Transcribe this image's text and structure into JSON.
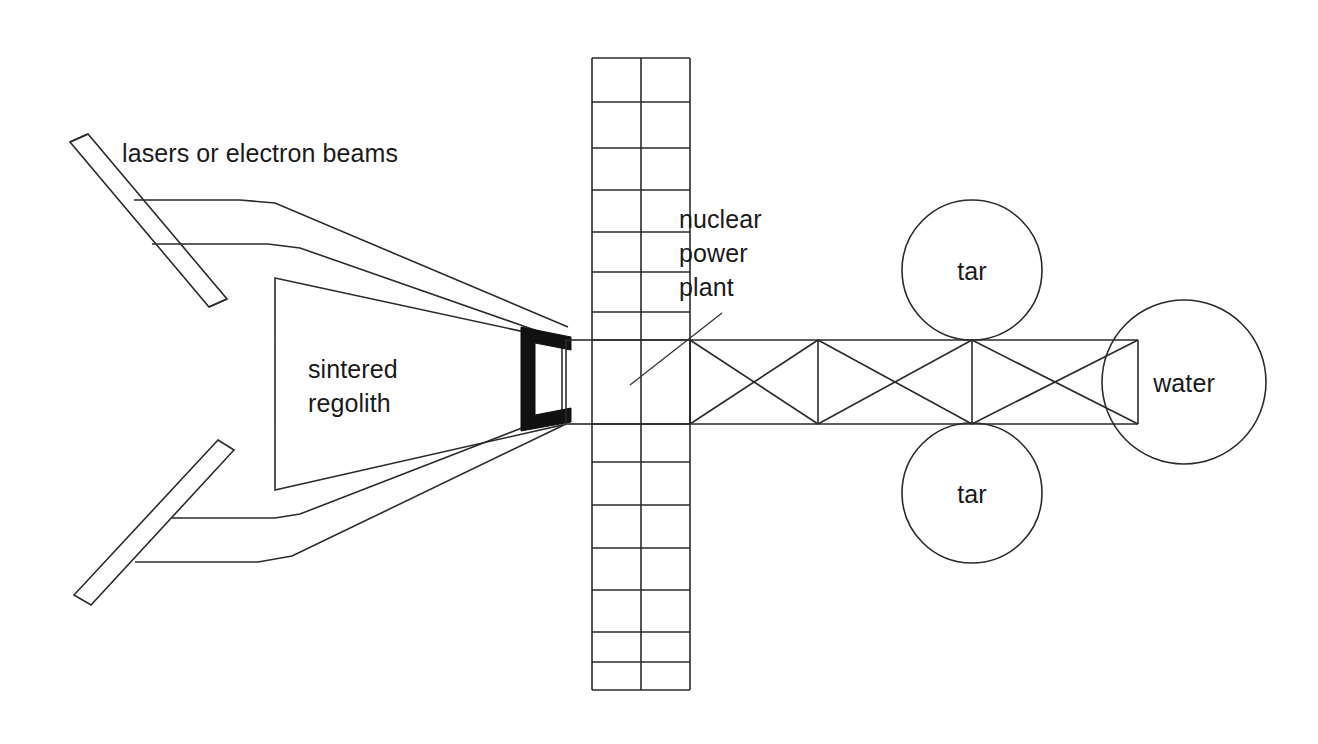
{
  "diagram": {
    "type": "technical-schematic",
    "background_color": "#ffffff",
    "line_color": "#2b2b2b",
    "accent_color": "#111111",
    "canvas": {
      "width": 1318,
      "height": 744
    }
  },
  "labels": {
    "lasers": "lasers or electron beams",
    "regolith_line1": "sintered",
    "regolith_line2": "regolith",
    "nuclear_line1": "nuclear",
    "nuclear_line2": "power",
    "nuclear_line3": "plant",
    "tar_top": "tar",
    "tar_bottom": "tar",
    "water": "water"
  },
  "components": [
    {
      "name": "beam-emitter-upper",
      "label": "lasers or electron beams",
      "shape": "slanted-bar"
    },
    {
      "name": "beam-emitter-lower",
      "label": "lasers or electron beams",
      "shape": "slanted-bar"
    },
    {
      "name": "funnel-upper",
      "shape": "polyline"
    },
    {
      "name": "funnel-lower",
      "shape": "polyline"
    },
    {
      "name": "sintered-regolith-block",
      "label": "sintered regolith",
      "shape": "trapezoid"
    },
    {
      "name": "black-bracket",
      "shape": "bracket",
      "color": "#111111"
    },
    {
      "name": "radiator-column",
      "shape": "ladder-grid",
      "columns": 2,
      "rows_top": 7,
      "rows_bottom": 7
    },
    {
      "name": "nuclear-power-plant-box",
      "label": "nuclear power plant",
      "shape": "rectangle"
    },
    {
      "name": "truss",
      "shape": "x-braced-truss",
      "bays": 3
    },
    {
      "name": "tank-tar-top",
      "label": "tar",
      "shape": "circle"
    },
    {
      "name": "tank-tar-bottom",
      "label": "tar",
      "shape": "circle"
    },
    {
      "name": "tank-water",
      "label": "water",
      "shape": "circle"
    }
  ]
}
